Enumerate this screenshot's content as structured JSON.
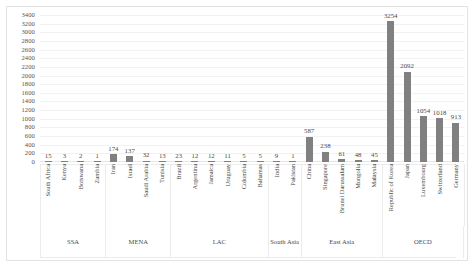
{
  "chart_data": {
    "type": "bar",
    "title": "",
    "subtitle": "",
    "xlabel": "",
    "ylabel": "",
    "ylim": [
      0,
      3400
    ],
    "ytick_step": 200,
    "yticks": [
      3400,
      3200,
      3000,
      2800,
      2600,
      2400,
      2200,
      2000,
      1800,
      1600,
      1400,
      1200,
      1000,
      800,
      600,
      400,
      200,
      0
    ],
    "grid": true,
    "legend": "none",
    "bar_color": "#808080",
    "data_labels": true,
    "categories": [
      "South Africa",
      "Kenya",
      "Botswana",
      "Zambia",
      "Iran",
      "Israel",
      "Saudi Arabia",
      "Tunisia",
      "Brazil",
      "Argentina",
      "Jamaica",
      "Uruguay",
      "Colombia",
      "Bahamas",
      "India",
      "Pakistan",
      "China",
      "Singapore",
      "Brunei Darussalam",
      "Mongolia",
      "Malaysia",
      "Republic of Korea",
      "Japan",
      "Luxembourg",
      "Switzerland",
      "Germany"
    ],
    "values": [
      15,
      3,
      2,
      1,
      174,
      137,
      32,
      13,
      23,
      12,
      12,
      11,
      5,
      5,
      9,
      1,
      587,
      238,
      61,
      48,
      45,
      3254,
      2092,
      1054,
      1018,
      913
    ],
    "groups": [
      {
        "label": "SSA",
        "count": 4
      },
      {
        "label": "MENA",
        "count": 4
      },
      {
        "label": "LAC",
        "count": 6
      },
      {
        "label": "South Asia",
        "count": 2
      },
      {
        "label": "East Asia",
        "count": 5
      },
      {
        "label": "OECD",
        "count": 5
      }
    ]
  }
}
